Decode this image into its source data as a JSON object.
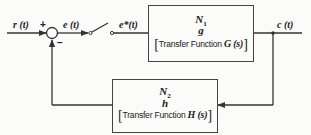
{
  "diagram": {
    "type": "sampled-data feedback control block diagram",
    "signals": {
      "input": "r (t)",
      "error": "e (t)",
      "sampled_error": "e*(t)",
      "output": "c (t)"
    },
    "summing_junction": {
      "plus_sign": "+",
      "minus_sign": "−"
    },
    "forward_block": {
      "numerator": "N",
      "numerator_sub": "1",
      "symbol": "g",
      "bracket_open": "[",
      "tf_text": "Transfer Function ",
      "tf_symbol": "G (s)",
      "bracket_close": "]"
    },
    "feedback_block": {
      "numerator": "N",
      "numerator_sub": "2",
      "symbol": "h",
      "bracket_open": "[",
      "tf_text": "Transfer Function ",
      "tf_symbol": "H (s)",
      "bracket_close": "]"
    },
    "colors": {
      "line": "#333333",
      "background": "#fbfbf9"
    }
  }
}
